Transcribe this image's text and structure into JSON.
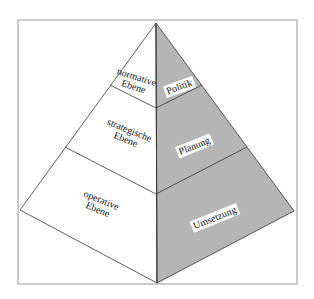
{
  "diagram": {
    "type": "pyramid",
    "colors": {
      "left_face": "#ffffff",
      "right_face": "#b5b5b5",
      "lines": "#333333",
      "frame": "#999999"
    },
    "left_face_levels": [
      {
        "line1": "normative",
        "line2": "Ebene"
      },
      {
        "line1": "strategische",
        "line2": "Ebene"
      },
      {
        "line1": "operative",
        "line2": "Ebene"
      }
    ],
    "right_face_levels": [
      {
        "label": "Politik"
      },
      {
        "label": "Planung"
      },
      {
        "label": "Umsetzung"
      }
    ]
  }
}
